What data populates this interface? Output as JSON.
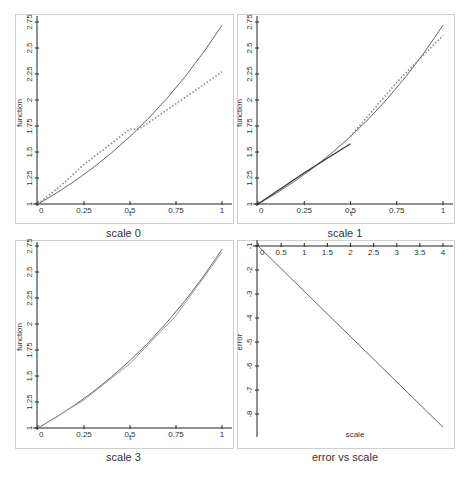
{
  "chart_data": [
    {
      "id": "scale0",
      "type": "line",
      "title": "scale 0",
      "xlabel": "t",
      "ylabel": "function",
      "xlim": [
        0,
        1
      ],
      "ylim": [
        1,
        2.75
      ],
      "xticks": [
        0,
        0.25,
        0.5,
        0.75,
        1
      ],
      "xtick_labels": [
        "0",
        "0.25",
        "0.5",
        "0.75",
        "1"
      ],
      "yticks": [
        1,
        1.25,
        1.5,
        1.75,
        2,
        2.25,
        2.5,
        2.75
      ],
      "ytick_labels": [
        "1",
        "1.25",
        "1.5",
        "1.75",
        "2",
        "2.25",
        "2.5",
        "2.75"
      ],
      "grid": false,
      "series": [
        {
          "name": "exact e^t",
          "style": "solid",
          "x": [
            0,
            0.1,
            0.2,
            0.3,
            0.4,
            0.5,
            0.6,
            0.7,
            0.8,
            0.9,
            1.0
          ],
          "y": [
            1.0,
            1.105,
            1.221,
            1.35,
            1.492,
            1.649,
            1.822,
            2.014,
            2.226,
            2.46,
            2.718
          ]
        },
        {
          "name": "approximation",
          "style": "dotted",
          "x": [
            0,
            0.12,
            0.25,
            0.5,
            0.55,
            1.0
          ],
          "y": [
            1.0,
            1.17,
            1.38,
            1.72,
            1.72,
            2.27
          ]
        }
      ]
    },
    {
      "id": "scale1",
      "type": "line",
      "title": "scale 1",
      "xlabel": "t",
      "ylabel": "function",
      "xlim": [
        0,
        1
      ],
      "ylim": [
        1,
        2.75
      ],
      "xticks": [
        0,
        0.25,
        0.5,
        0.75,
        1
      ],
      "xtick_labels": [
        "0",
        "0.25",
        "0.5",
        "0.75",
        "1"
      ],
      "yticks": [
        1,
        1.25,
        1.5,
        1.75,
        2,
        2.25,
        2.5,
        2.75
      ],
      "ytick_labels": [
        "1",
        "1.25",
        "1.5",
        "1.75",
        "2",
        "2.25",
        "2.5",
        "2.75"
      ],
      "grid": false,
      "series": [
        {
          "name": "exact e^t",
          "style": "solid",
          "x": [
            0,
            0.1,
            0.2,
            0.3,
            0.4,
            0.5,
            0.6,
            0.7,
            0.8,
            0.9,
            1.0
          ],
          "y": [
            1.0,
            1.105,
            1.221,
            1.35,
            1.492,
            1.649,
            1.822,
            2.014,
            2.226,
            2.46,
            2.718
          ]
        },
        {
          "name": "approximation segment 1",
          "style": "solid-dark",
          "x": [
            0,
            0.25,
            0.5
          ],
          "y": [
            1.0,
            1.3,
            1.58
          ]
        },
        {
          "name": "approximation segment 2",
          "style": "dotted",
          "x": [
            0.5,
            0.75,
            1.0
          ],
          "y": [
            1.65,
            2.17,
            2.62
          ]
        }
      ]
    },
    {
      "id": "scale3",
      "type": "line",
      "title": "scale 3",
      "xlabel": "t",
      "ylabel": "function",
      "xlim": [
        0,
        1
      ],
      "ylim": [
        1,
        2.75
      ],
      "xticks": [
        0,
        0.25,
        0.5,
        0.75,
        1
      ],
      "xtick_labels": [
        "0",
        "0.25",
        "0.5",
        "0.75",
        "1"
      ],
      "yticks": [
        1,
        1.25,
        1.5,
        1.75,
        2,
        2.25,
        2.5,
        2.75
      ],
      "ytick_labels": [
        "1",
        "1.25",
        "1.5",
        "1.75",
        "2",
        "2.25",
        "2.5",
        "2.75"
      ],
      "grid": false,
      "series": [
        {
          "name": "exact e^t",
          "style": "solid",
          "x": [
            0,
            0.1,
            0.2,
            0.3,
            0.4,
            0.5,
            0.6,
            0.7,
            0.8,
            0.9,
            1.0
          ],
          "y": [
            1.0,
            1.105,
            1.221,
            1.35,
            1.492,
            1.649,
            1.822,
            2.014,
            2.226,
            2.46,
            2.718
          ]
        },
        {
          "name": "approximation",
          "style": "solid-light",
          "x": [
            0,
            0.25,
            0.5,
            0.75,
            1.0
          ],
          "y": [
            1.0,
            1.27,
            1.62,
            2.08,
            2.69
          ]
        }
      ]
    },
    {
      "id": "error",
      "type": "line",
      "title": "error vs scale",
      "xlabel": "scale",
      "ylabel": "error",
      "xlim": [
        0,
        4
      ],
      "ylim": [
        -9,
        -1
      ],
      "xticks": [
        0,
        0.5,
        1,
        1.5,
        2,
        2.5,
        3,
        3.5,
        4
      ],
      "xtick_labels": [
        "0",
        "0.5",
        "1",
        "1.5",
        "2",
        "2.5",
        "3",
        "3.5",
        "4"
      ],
      "yticks": [
        -1,
        -2,
        -3,
        -4,
        -5,
        -6,
        -7,
        -8
      ],
      "ytick_labels": [
        "-1",
        "-2",
        "-3",
        "-4",
        "-5",
        "-6",
        "-7",
        "-8"
      ],
      "grid": false,
      "series": [
        {
          "name": "error",
          "style": "solid",
          "x": [
            0,
            4
          ],
          "y": [
            -1.0,
            -8.55
          ]
        }
      ]
    }
  ],
  "captions": {
    "scale0": "scale 0",
    "scale1": "scale 1",
    "scale3": "scale 3",
    "error": "error vs scale"
  },
  "axis_labels": {
    "t": "t",
    "function": "function",
    "scale": "scale",
    "error": "error"
  },
  "colors": {
    "axis": "#222222",
    "exact": "#555555",
    "approx_dotted": "#8a8a8a",
    "approx_dark": "#333333",
    "approx_light": "#9a9a9a",
    "frame": "#cfcfcf"
  }
}
